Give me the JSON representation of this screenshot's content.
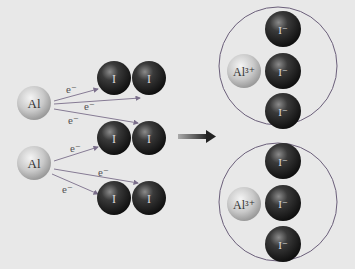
{
  "diagram": {
    "reactants": {
      "aluminum_atoms": [
        {
          "label": "Al",
          "cx": 34,
          "cy": 103
        },
        {
          "label": "Al",
          "cx": 34,
          "cy": 163
        }
      ],
      "iodine_molecules": [
        {
          "atoms": [
            "I",
            "I"
          ],
          "cy": 78
        },
        {
          "atoms": [
            "I",
            "I"
          ],
          "cy": 138
        },
        {
          "atoms": [
            "I",
            "I"
          ],
          "cy": 198
        }
      ],
      "electron_label": "e⁻",
      "electron_transfers": 6
    },
    "arrow": {
      "direction": "right",
      "color": "#2a2a2a"
    },
    "products": {
      "formula_units": [
        {
          "cation": "Al³⁺",
          "anions": [
            "I⁻",
            "I⁻",
            "I⁻"
          ]
        },
        {
          "cation": "Al³⁺",
          "anions": [
            "I⁻",
            "I⁻",
            "I⁻"
          ]
        }
      ]
    },
    "colors": {
      "background": "#e8e8e8",
      "aluminum": "#c8c8c8",
      "iodine": "#2a2a2a",
      "arrow_lines": "#7a6e8a",
      "circle_outline": "#6b5f7a"
    }
  }
}
